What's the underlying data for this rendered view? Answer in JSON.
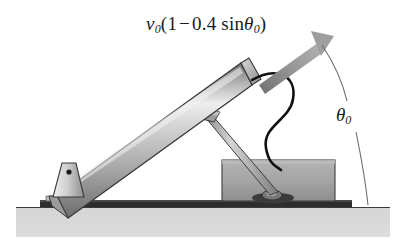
{
  "figure": {
    "background_color": "#ffffff"
  },
  "labels": {
    "velocity": {
      "symbol": "v",
      "symbol_sub": "0",
      "open_paren": "(",
      "one": "1",
      "minus": "−",
      "coefficient": "0.4",
      "function": "sin",
      "angle_symbol": "θ",
      "angle_sub": "0",
      "close_paren": ")",
      "full_text": "v0(1 − 0.4 sinθ0)"
    },
    "angle": {
      "symbol": "θ",
      "sub": "0",
      "full_text": "θ0"
    }
  },
  "colors": {
    "outline": "#2b2b2b",
    "barrel_light": "#e8e8e8",
    "barrel_mid": "#b4b4b4",
    "barrel_dark": "#6f6f6f",
    "box_fill": "#a0a0a0",
    "box_dark": "#8a8a8a",
    "base_plate": "#2a2a2a",
    "ground_fill": "#d8d8d8",
    "arrow_fill": "#8c8c8c",
    "cable": "#111111",
    "arc_line": "#6a6a6a",
    "strut": "#9b9b9b"
  },
  "parts": [
    {
      "name": "cannon-barrel",
      "description": "long shaded cylinder inclined up-left to down-right"
    },
    {
      "name": "muzzle-end-cap",
      "description": "angled flat cap at upper-right end of barrel"
    },
    {
      "name": "pivot-bracket",
      "description": "trapezoidal mount with pin hole at lower-left"
    },
    {
      "name": "pivot-pin",
      "description": "small dark circular pin in bracket"
    },
    {
      "name": "support-strut",
      "description": "thin diagonal rod from barrel underside to box mount"
    },
    {
      "name": "recoil-box",
      "description": "gray rectangular housing on base plate"
    },
    {
      "name": "strut-foot-mount",
      "description": "dark rounded mount at bottom of strut on box"
    },
    {
      "name": "base-plate",
      "description": "dark horizontal plate resting on the ground"
    },
    {
      "name": "ground-hatch",
      "description": "light gray hatched ground band"
    },
    {
      "name": "velocity-arrow",
      "description": "thick gray arrow from muzzle pointing up-right"
    },
    {
      "name": "cable",
      "description": "black S-curved cable from muzzle to box"
    },
    {
      "name": "angle-arc",
      "description": "thin arc from arrow direction to ground indicating theta-zero"
    }
  ]
}
